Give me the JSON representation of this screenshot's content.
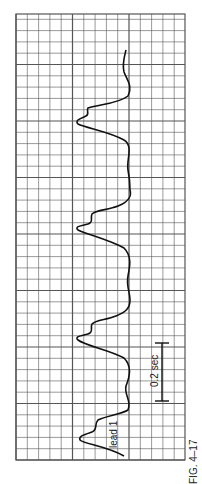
{
  "figure": {
    "caption": "FIG. 4–17",
    "lead_label": "lead 1",
    "scale_label": "0.2 sec",
    "orientation": "rotated 90 degrees counter-clockwise",
    "grid": {
      "x0": 16,
      "y0": 14,
      "x1": 185,
      "y1": 460,
      "cell": 11.3,
      "major_every": 5
    },
    "colors": {
      "grid": "#555555",
      "trace": "#111111",
      "background": "#ffffff"
    }
  }
}
